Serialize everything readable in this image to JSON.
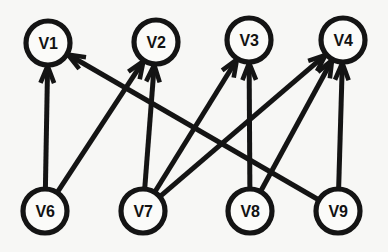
{
  "figure": {
    "name": "directed-bipartite-graph",
    "background_color": "#f7f7f5",
    "stroke_color": "#141414",
    "node_fill_color": "#fbfbf9",
    "width": 388,
    "height": 252
  },
  "nodes": [
    {
      "id": "V1",
      "label": "V1",
      "cx": 48,
      "cy": 43,
      "r": 22,
      "row": "top"
    },
    {
      "id": "V2",
      "label": "V2",
      "cx": 156,
      "cy": 42,
      "r": 22,
      "row": "top"
    },
    {
      "id": "V3",
      "label": "V3",
      "cx": 249,
      "cy": 40,
      "r": 22,
      "row": "top"
    },
    {
      "id": "V4",
      "label": "V4",
      "cx": 343,
      "cy": 40,
      "r": 22,
      "row": "top"
    },
    {
      "id": "V6",
      "label": "V6",
      "cx": 45,
      "cy": 211,
      "r": 22,
      "row": "bottom"
    },
    {
      "id": "V7",
      "label": "V7",
      "cx": 143,
      "cy": 211,
      "r": 22,
      "row": "bottom"
    },
    {
      "id": "V8",
      "label": "V8",
      "cx": 250,
      "cy": 211,
      "r": 22,
      "row": "bottom"
    },
    {
      "id": "V9",
      "label": "V9",
      "cx": 338,
      "cy": 211,
      "r": 22,
      "row": "bottom"
    }
  ],
  "edges": [
    {
      "from": "V6",
      "to": "V1",
      "directed": true
    },
    {
      "from": "V6",
      "to": "V2",
      "directed": true
    },
    {
      "from": "V7",
      "to": "V2",
      "directed": true
    },
    {
      "from": "V7",
      "to": "V3",
      "directed": true
    },
    {
      "from": "V7",
      "to": "V4",
      "directed": true
    },
    {
      "from": "V8",
      "to": "V3",
      "directed": true
    },
    {
      "from": "V8",
      "to": "V4",
      "directed": true
    },
    {
      "from": "V9",
      "to": "V1",
      "directed": true
    },
    {
      "from": "V9",
      "to": "V4",
      "directed": true
    }
  ]
}
